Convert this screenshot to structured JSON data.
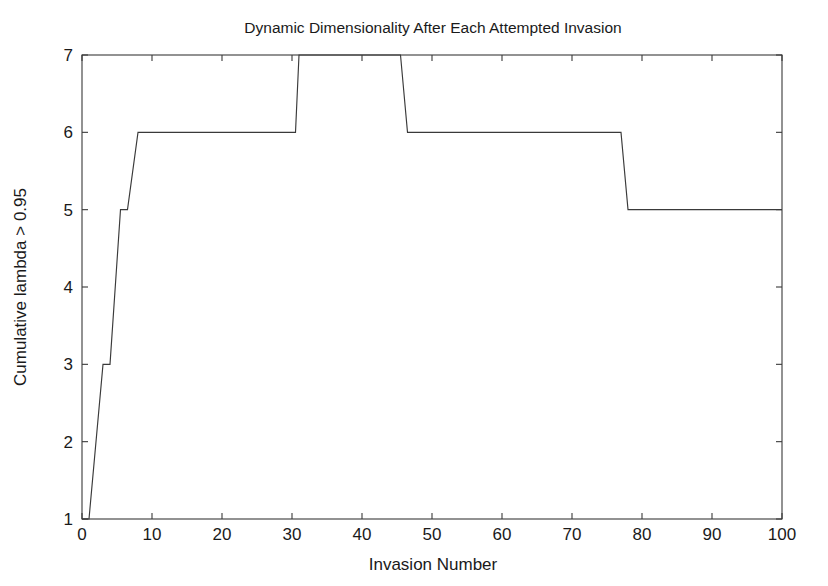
{
  "chart_data": {
    "type": "line",
    "title": "Dynamic Dimensionality After Each Attempted Invasion",
    "xlabel": "Invasion Number",
    "ylabel": "Cumulative lambda > 0.95",
    "xlim": [
      0,
      100
    ],
    "ylim": [
      1,
      7
    ],
    "xticks": [
      0,
      10,
      20,
      30,
      40,
      50,
      60,
      70,
      80,
      90,
      100
    ],
    "xtick_labels": [
      "0",
      "10",
      "20",
      "30",
      "40",
      "50",
      "60",
      "70",
      "80",
      "90",
      "100"
    ],
    "yticks": [
      1,
      2,
      3,
      4,
      5,
      6,
      7
    ],
    "ytick_labels": [
      "1",
      "2",
      "3",
      "4",
      "5",
      "6",
      "7"
    ],
    "grid": false,
    "legend": null,
    "line_color": "#3a3a3a",
    "box": true,
    "tick_direction": "in",
    "series": [
      {
        "name": "Cumulative lambda > 0.95",
        "step": true,
        "x": [
          0,
          1,
          3,
          4,
          5.5,
          6.5,
          8,
          30.5,
          31,
          45.5,
          46.5,
          77,
          78,
          100
        ],
        "y": [
          1,
          1,
          3,
          3,
          5,
          5,
          6,
          6,
          7,
          7,
          6,
          6,
          5,
          5
        ],
        "points": [
          {
            "x": 0,
            "y": 1
          },
          {
            "x": 1,
            "y": 1
          },
          {
            "x": 3,
            "y": 3
          },
          {
            "x": 4,
            "y": 3
          },
          {
            "x": 5.5,
            "y": 5
          },
          {
            "x": 6.5,
            "y": 5
          },
          {
            "x": 8,
            "y": 6
          },
          {
            "x": 30.5,
            "y": 6
          },
          {
            "x": 31,
            "y": 7
          },
          {
            "x": 45.5,
            "y": 7
          },
          {
            "x": 46.5,
            "y": 6
          },
          {
            "x": 77,
            "y": 6
          },
          {
            "x": 78,
            "y": 5
          },
          {
            "x": 100,
            "y": 5
          }
        ]
      }
    ],
    "annotations": []
  },
  "figure": {
    "background_color": "#ffffff",
    "axes_color": "#3a3a3a"
  }
}
